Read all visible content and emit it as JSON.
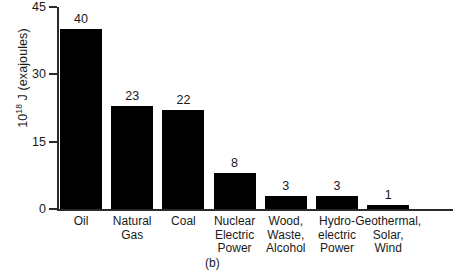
{
  "chart_data": {
    "type": "bar",
    "title": "",
    "subtitle": "",
    "xlabel": "",
    "ylabel": "10¹⁸ J (exajoules)",
    "ylabel_base": "10",
    "ylabel_exponent": "18",
    "ylabel_rest": " J (exajoules)",
    "categories": [
      "Oil",
      "Natural Gas",
      "Coal",
      "Nuclear Electric Power",
      "Wood, Waste, Alcohol",
      "Hydro-electric Power",
      "Geothermal, Solar, Wind"
    ],
    "category_lines": [
      [
        "Oil"
      ],
      [
        "Natural",
        "Gas"
      ],
      [
        "Coal"
      ],
      [
        "Nuclear",
        "Electric",
        "Power"
      ],
      [
        "Wood,",
        "Waste,",
        "Alcohol"
      ],
      [
        "Hydro-",
        "electric",
        "Power"
      ],
      [
        "Geothermal,",
        "Solar,",
        "Wind"
      ]
    ],
    "values": [
      40,
      23,
      22,
      8,
      3,
      3,
      1
    ],
    "value_labels": [
      "40",
      "23",
      "22",
      "8",
      "3",
      "3",
      "1"
    ],
    "ylim": [
      0,
      45
    ],
    "yticks": [
      0,
      15,
      30,
      45
    ],
    "ytick_labels": [
      "0",
      "15",
      "30",
      "45"
    ],
    "grid": false,
    "legend": null,
    "bar_color": "#000000",
    "axis_color": "#2a2a2a",
    "text_color": "#1a1a1a",
    "background_color": "#ffffff"
  },
  "caption": {
    "label": "(b)"
  }
}
